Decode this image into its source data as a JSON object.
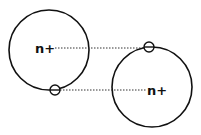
{
  "diagram": {
    "colors": {
      "stroke": "#111111",
      "background": "#ffffff"
    },
    "ions": [
      {
        "id": "ion-left",
        "label": "n+",
        "cx": 49,
        "cy": 50,
        "r": 40
      },
      {
        "id": "ion-right",
        "label": "n+",
        "cx": 152,
        "cy": 87,
        "r": 40
      }
    ],
    "electrons": [
      {
        "id": "electron-right-top",
        "symbol": "−",
        "cx": 149,
        "cy": 47,
        "r": 5
      },
      {
        "id": "electron-left-bottom",
        "symbol": "−",
        "cx": 55,
        "cy": 90,
        "r": 5
      }
    ],
    "attractions": [
      {
        "from": "ion-left label n+",
        "to": "electron-right-top",
        "style": "dotted"
      },
      {
        "from": "electron-left-bottom",
        "to": "ion-right label n+",
        "style": "dotted"
      }
    ]
  }
}
